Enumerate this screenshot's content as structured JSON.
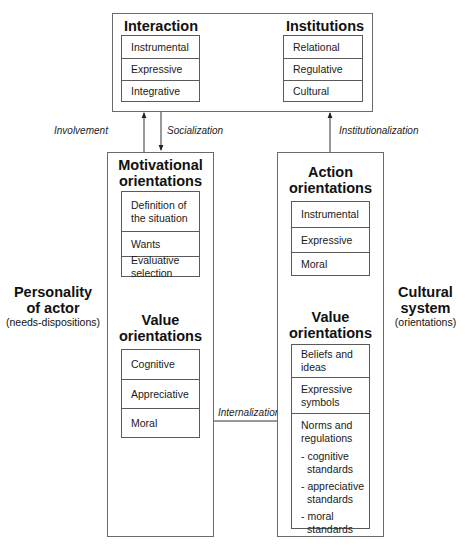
{
  "top_box": {
    "interaction": {
      "title": "Interaction",
      "items": [
        "Instrumental",
        "Expressive",
        "Integrative"
      ]
    },
    "institutions": {
      "title": "Institutions",
      "items": [
        "Relational",
        "Regulative",
        "Cultural"
      ]
    }
  },
  "arrows": {
    "involvement": "Involvement",
    "socialization": "Socialization",
    "institutionalization": "Institutionalization",
    "internalization": "Internalization"
  },
  "personality": {
    "side_title_line1": "Personality",
    "side_title_line2": "of actor",
    "side_subtitle": "(needs-dispositions)",
    "motivational": {
      "title_line1": "Motivational",
      "title_line2": "orientations",
      "items": [
        [
          "Definition of",
          "the situation"
        ],
        [
          "Wants"
        ],
        [
          "Evaluative",
          "selection"
        ]
      ]
    },
    "value": {
      "title_line1": "Value",
      "title_line2": "orientations",
      "items": [
        "Cognitive",
        "Appreciative",
        "Moral"
      ]
    }
  },
  "cultural": {
    "side_title_line1": "Cultural",
    "side_title_line2": "system",
    "side_subtitle": "(orientations)",
    "action": {
      "title_line1": "Action",
      "title_line2": "orientations",
      "items": [
        "Instrumental",
        "Expressive",
        "Moral"
      ]
    },
    "value": {
      "title_line1": "Value",
      "title_line2": "orientations",
      "items": [
        [
          "Beliefs and",
          "ideas"
        ],
        [
          "Expressive",
          "symbols"
        ]
      ],
      "norms": {
        "line1": "Norms and",
        "line2": "regulations",
        "standards": [
          [
            "- cognitive",
            "standards"
          ],
          [
            "- appreciative",
            "standards"
          ],
          [
            "- moral",
            "standards"
          ]
        ]
      }
    }
  }
}
